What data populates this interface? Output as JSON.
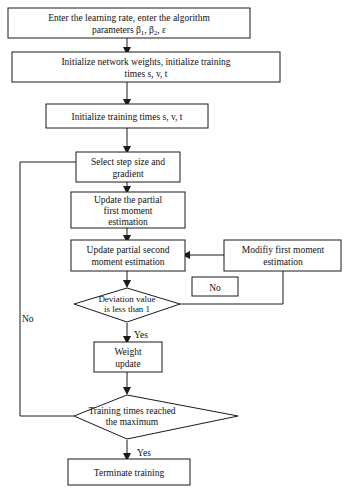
{
  "diagram": {
    "type": "flowchart",
    "nodes": [
      {
        "id": "n1",
        "shape": "process",
        "lines": [
          "Enter the learning rate, enter the algorithm",
          "parameters β 1,  β 2,  ε"
        ],
        "line1": "Enter the learning rate, enter the algorithm",
        "line2_pre": "parameters β",
        "line2_sub1": "1",
        "line2_mid": ",  β",
        "line2_sub2": "2",
        "line2_post": ",  ε"
      },
      {
        "id": "n2",
        "shape": "process",
        "line1": "Initialize network weights, initialize training",
        "line2": "times s, v, t"
      },
      {
        "id": "n3",
        "shape": "process",
        "line1": "Initialize training times s, v, t"
      },
      {
        "id": "n4",
        "shape": "process",
        "line1": "Select step size and",
        "line2": "gradient"
      },
      {
        "id": "n5",
        "shape": "process",
        "line1": "Update the partial",
        "line2": "first moment",
        "line3": "estimation"
      },
      {
        "id": "n6",
        "shape": "process",
        "line1": "Update partial second",
        "line2": "moment estimation"
      },
      {
        "id": "n7",
        "shape": "process",
        "line1": "Modifiy first moment",
        "line2": "estimation"
      },
      {
        "id": "d1",
        "shape": "decision",
        "line1": "Deviation value",
        "line2": "is less than 1"
      },
      {
        "id": "n8",
        "shape": "process",
        "line1": "Weight",
        "line2": "update"
      },
      {
        "id": "d2",
        "shape": "decision",
        "line1": "Training times reached",
        "line2": "the maximum"
      },
      {
        "id": "n9",
        "shape": "process",
        "line1": "Terminate training"
      },
      {
        "id": "nobox",
        "shape": "process",
        "line1": "No"
      }
    ],
    "edge_labels": {
      "deviation_yes": "Yes",
      "deviation_no_left": "No",
      "training_yes": "Yes"
    },
    "colors": {
      "stroke": "#1a1a1a",
      "fill": "#ffffff",
      "text": "#111111"
    }
  }
}
